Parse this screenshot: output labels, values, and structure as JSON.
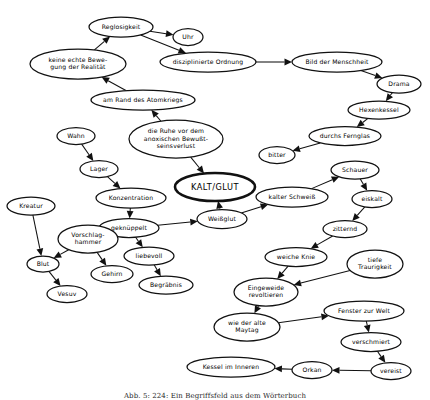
{
  "figure": {
    "caption": "Abb. 5: 224: Ein Begriffsfeld aus dem Wörterbuch",
    "background_color": "#ffffff",
    "stroke_color": "#111111",
    "width": 430,
    "height": 400
  },
  "nodes": [
    {
      "id": "reglosigkeit",
      "label": "Reglosigkeit",
      "lines": [
        "Reglosigkeit"
      ],
      "cx": 121,
      "cy": 27,
      "rx": 32,
      "ry": 10,
      "emphasis": false
    },
    {
      "id": "uhr",
      "label": "Uhr",
      "lines": [
        "Uhr"
      ],
      "cx": 188,
      "cy": 37,
      "rx": 15,
      "ry": 8.5,
      "emphasis": false
    },
    {
      "id": "keine-echte-bewegung",
      "label": "keine echte Bewegung der Realität",
      "lines": [
        "keine echte Bewe-",
        "gung der Realität"
      ],
      "cx": 78,
      "cy": 64,
      "rx": 48,
      "ry": 15,
      "emphasis": false
    },
    {
      "id": "disziplinierte-ordnung",
      "label": "disziplinierte Ordnung",
      "lines": [
        "disziplinierte Ordnung"
      ],
      "cx": 208,
      "cy": 62,
      "rx": 48,
      "ry": 10,
      "emphasis": false
    },
    {
      "id": "bild-der-menschheit",
      "label": "Bild der Menschheit",
      "lines": [
        "Bild der Menschheit"
      ],
      "cx": 337,
      "cy": 62,
      "rx": 45,
      "ry": 10,
      "emphasis": false
    },
    {
      "id": "drama",
      "label": "Drama",
      "lines": [
        "Drama"
      ],
      "cx": 399,
      "cy": 84,
      "rx": 22,
      "ry": 9,
      "emphasis": false
    },
    {
      "id": "hexenkessel",
      "label": "Hexenkessel",
      "lines": [
        "Hexenkessel"
      ],
      "cx": 379,
      "cy": 110,
      "rx": 31,
      "ry": 9,
      "emphasis": false
    },
    {
      "id": "durchs-fernglas",
      "label": "durchs Fernglas",
      "lines": [
        "durchs Fernglas"
      ],
      "cx": 345,
      "cy": 136,
      "rx": 36,
      "ry": 9.5,
      "emphasis": false
    },
    {
      "id": "bitter",
      "label": "bitter",
      "lines": [
        "bitter"
      ],
      "cx": 277,
      "cy": 155,
      "rx": 18,
      "ry": 8.5,
      "emphasis": false
    },
    {
      "id": "am-rand-des-atomkriegs",
      "label": "am Rand des Atomkriegs",
      "lines": [
        "am Rand des Atomkriegs"
      ],
      "cx": 143,
      "cy": 100,
      "rx": 52,
      "ry": 10,
      "emphasis": false
    },
    {
      "id": "die-ruhe",
      "label": "die Ruhe vor dem anoxischen Bewußtseinsverlust",
      "lines": [
        "die Ruhe vor dem",
        "anoxischen Bewußt-",
        "seinsverlust"
      ],
      "cx": 176,
      "cy": 139,
      "rx": 47,
      "ry": 19,
      "emphasis": false
    },
    {
      "id": "wahn",
      "label": "Wahn",
      "lines": [
        "Wahn"
      ],
      "cx": 76,
      "cy": 136,
      "rx": 19,
      "ry": 8.5,
      "emphasis": false
    },
    {
      "id": "lager",
      "label": "Lager",
      "lines": [
        "Lager"
      ],
      "cx": 99,
      "cy": 169,
      "rx": 19,
      "ry": 8.5,
      "emphasis": false
    },
    {
      "id": "konzentration",
      "label": "Konzentration",
      "lines": [
        "Konzentration"
      ],
      "cx": 131,
      "cy": 198,
      "rx": 35,
      "ry": 10,
      "emphasis": false
    },
    {
      "id": "kalt-glut",
      "label": "KALT/GLUT",
      "lines": [
        "KALT/GLUT"
      ],
      "cx": 215,
      "cy": 187,
      "rx": 40,
      "ry": 14,
      "emphasis": true
    },
    {
      "id": "weissglut",
      "label": "Weißglut",
      "lines": [
        "Weißglut"
      ],
      "cx": 222,
      "cy": 219,
      "rx": 25,
      "ry": 9.5,
      "emphasis": false
    },
    {
      "id": "geknueppelt",
      "label": "geknüppelt",
      "lines": [
        "geknüppelt"
      ],
      "cx": 129,
      "cy": 228,
      "rx": 30,
      "ry": 9.5,
      "emphasis": false
    },
    {
      "id": "kalter-schweiss",
      "label": "kalter Schweiß",
      "lines": [
        "kalter Schweiß"
      ],
      "cx": 292,
      "cy": 197,
      "rx": 36,
      "ry": 10,
      "emphasis": false
    },
    {
      "id": "schauer",
      "label": "Schauer",
      "lines": [
        "Schauer"
      ],
      "cx": 355,
      "cy": 170,
      "rx": 24,
      "ry": 9,
      "emphasis": false
    },
    {
      "id": "eiskalt",
      "label": "eiskalt",
      "lines": [
        "eiskalt"
      ],
      "cx": 372,
      "cy": 199,
      "rx": 20,
      "ry": 8.5,
      "emphasis": false
    },
    {
      "id": "zitternd",
      "label": "zitternd",
      "lines": [
        "zitternd"
      ],
      "cx": 345,
      "cy": 229,
      "rx": 22,
      "ry": 8.5,
      "emphasis": false
    },
    {
      "id": "weiche-knie",
      "label": "weiche Knie",
      "lines": [
        "weiche Knie"
      ],
      "cx": 296,
      "cy": 257,
      "rx": 31,
      "ry": 9.5,
      "emphasis": false
    },
    {
      "id": "tiefe-traurigkeit",
      "label": "tiefe Traurigkeit",
      "lines": [
        "tiefe",
        "Traurigkeit"
      ],
      "cx": 375,
      "cy": 264,
      "rx": 28,
      "ry": 14,
      "emphasis": false
    },
    {
      "id": "eingeweide-revoltieren",
      "label": "Eingeweide revoltieren",
      "lines": [
        "Eingeweide",
        "revoltieren"
      ],
      "cx": 266,
      "cy": 292,
      "rx": 32,
      "ry": 14,
      "emphasis": false
    },
    {
      "id": "liebevoll",
      "label": "liebevoll",
      "lines": [
        "liebevoll"
      ],
      "cx": 149,
      "cy": 256,
      "rx": 25,
      "ry": 9,
      "emphasis": false
    },
    {
      "id": "begraebnis",
      "label": "Begräbnis",
      "lines": [
        "Begräbnis"
      ],
      "cx": 166,
      "cy": 285,
      "rx": 27,
      "ry": 9,
      "emphasis": false
    },
    {
      "id": "kreatur",
      "label": "Kreatur",
      "lines": [
        "Kreatur"
      ],
      "cx": 31,
      "cy": 206,
      "rx": 24,
      "ry": 9,
      "emphasis": false
    },
    {
      "id": "vorschlaghammer",
      "label": "Vorschlaghammer",
      "lines": [
        "Vorschlag-",
        "hammer"
      ],
      "cx": 88,
      "cy": 239,
      "rx": 30,
      "ry": 14,
      "emphasis": false
    },
    {
      "id": "blut",
      "label": "Blut",
      "lines": [
        "Blut"
      ],
      "cx": 43,
      "cy": 264,
      "rx": 16,
      "ry": 8,
      "emphasis": false
    },
    {
      "id": "gehirn",
      "label": "Gehirn",
      "lines": [
        "Gehirn"
      ],
      "cx": 112,
      "cy": 274,
      "rx": 21,
      "ry": 8.5,
      "emphasis": false
    },
    {
      "id": "vesuv",
      "label": "Vesuv",
      "lines": [
        "Vesuv"
      ],
      "cx": 67,
      "cy": 294,
      "rx": 20,
      "ry": 8.5,
      "emphasis": false
    },
    {
      "id": "wie-der-alte-maytag",
      "label": "wie der alte Maytag",
      "lines": [
        "wie der alte",
        "Maytag"
      ],
      "cx": 247,
      "cy": 327,
      "rx": 33,
      "ry": 14,
      "emphasis": false
    },
    {
      "id": "fenster-zur-welt",
      "label": "Fenster zur Welt",
      "lines": [
        "Fenster zur Welt"
      ],
      "cx": 364,
      "cy": 311,
      "rx": 40,
      "ry": 10,
      "emphasis": false
    },
    {
      "id": "verschmiert",
      "label": "verschmiert",
      "lines": [
        "verschmiert"
      ],
      "cx": 371,
      "cy": 342,
      "rx": 30,
      "ry": 9.5,
      "emphasis": false
    },
    {
      "id": "vereist",
      "label": "vereist",
      "lines": [
        "vereist"
      ],
      "cx": 391,
      "cy": 371,
      "rx": 20,
      "ry": 8.5,
      "emphasis": false
    },
    {
      "id": "orkan",
      "label": "Orkan",
      "lines": [
        "Orkan"
      ],
      "cx": 312,
      "cy": 370,
      "rx": 20,
      "ry": 8.5,
      "emphasis": false
    },
    {
      "id": "kessel-im-inneren",
      "label": "Kessel im Inneren",
      "lines": [
        "Kessel im Inneren"
      ],
      "cx": 231,
      "cy": 367,
      "rx": 44,
      "ry": 10,
      "emphasis": false
    }
  ],
  "edges": [
    {
      "from": "reglosigkeit",
      "to": "uhr"
    },
    {
      "from": "reglosigkeit",
      "to": "disziplinierte-ordnung"
    },
    {
      "from": "keine-echte-bewegung",
      "to": "reglosigkeit"
    },
    {
      "from": "am-rand-des-atomkriegs",
      "to": "keine-echte-bewegung"
    },
    {
      "from": "disziplinierte-ordnung",
      "to": "bild-der-menschheit"
    },
    {
      "from": "bild-der-menschheit",
      "to": "drama"
    },
    {
      "from": "drama",
      "to": "hexenkessel"
    },
    {
      "from": "hexenkessel",
      "to": "durchs-fernglas"
    },
    {
      "from": "durchs-fernglas",
      "to": "bitter"
    },
    {
      "from": "die-ruhe",
      "to": "am-rand-des-atomkriegs"
    },
    {
      "from": "die-ruhe",
      "to": "kalt-glut"
    },
    {
      "from": "wahn",
      "to": "lager"
    },
    {
      "from": "lager",
      "to": "konzentration"
    },
    {
      "from": "konzentration",
      "to": "geknueppelt"
    },
    {
      "from": "geknueppelt",
      "to": "weissglut"
    },
    {
      "from": "weissglut",
      "to": "kalt-glut"
    },
    {
      "from": "weissglut",
      "to": "kalter-schweiss"
    },
    {
      "from": "kalter-schweiss",
      "to": "schauer"
    },
    {
      "from": "schauer",
      "to": "eiskalt"
    },
    {
      "from": "eiskalt",
      "to": "zitternd"
    },
    {
      "from": "zitternd",
      "to": "weiche-knie"
    },
    {
      "from": "weiche-knie",
      "to": "eingeweide-revoltieren"
    },
    {
      "from": "tiefe-traurigkeit",
      "to": "eingeweide-revoltieren"
    },
    {
      "from": "geknueppelt",
      "to": "liebevoll"
    },
    {
      "from": "liebevoll",
      "to": "begraebnis"
    },
    {
      "from": "kreatur",
      "to": "blut"
    },
    {
      "from": "vorschlaghammer",
      "to": "blut"
    },
    {
      "from": "vorschlaghammer",
      "to": "gehirn"
    },
    {
      "from": "blut",
      "to": "vesuv"
    },
    {
      "from": "eingeweide-revoltieren",
      "to": "wie-der-alte-maytag"
    },
    {
      "from": "wie-der-alte-maytag",
      "to": "fenster-zur-welt"
    },
    {
      "from": "fenster-zur-welt",
      "to": "verschmiert"
    },
    {
      "from": "verschmiert",
      "to": "vereist"
    },
    {
      "from": "vereist",
      "to": "orkan"
    },
    {
      "from": "orkan",
      "to": "kessel-im-inneren"
    }
  ]
}
